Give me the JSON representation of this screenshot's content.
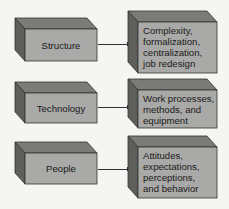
{
  "diagram": {
    "type": "block-diagram",
    "colors": {
      "front_face": "#a9a9a7",
      "top_face": "#7b7b79",
      "side_face": "#5e5e5c",
      "edge": "#333333",
      "background": "#f5f5f3"
    },
    "rows": [
      {
        "source": {
          "label": "Structure"
        },
        "target": {
          "label": "Complexity,\nformalization,\ncentralization,\njob redesign"
        }
      },
      {
        "source": {
          "label": "Technology"
        },
        "target": {
          "label": "Work processes,\nmethods, and\nequipment"
        }
      },
      {
        "source": {
          "label": "People"
        },
        "target": {
          "label": "Attitudes,\nexpectations,\nperceptions,\nand behavior"
        }
      }
    ]
  }
}
